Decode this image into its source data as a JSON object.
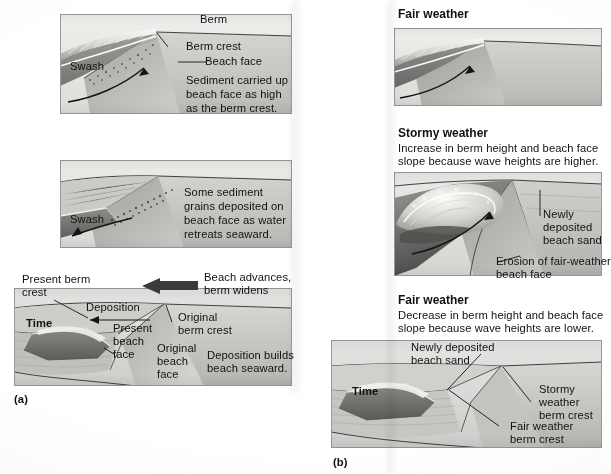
{
  "figure": {
    "part_a_label": "(a)",
    "part_b_label": "(b)"
  },
  "colors": {
    "paper": "#ffffff",
    "sand_light": "#dcdcda",
    "sand_mid": "#bdbdba",
    "sand_dark": "#8e8e8b",
    "water_dark": "#6f6f6d",
    "water_mid": "#9a9a97",
    "foam": "#f2f2f0",
    "ink": "#111111",
    "panel_bg": "#d6d6d4"
  },
  "part_a": {
    "label": "(a)",
    "panels": [
      {
        "id": "a1",
        "labels": [
          {
            "name": "berm",
            "text": "Berm"
          },
          {
            "name": "berm-crest",
            "text": "Berm crest"
          },
          {
            "name": "beach-face",
            "text": "Beach face"
          },
          {
            "name": "swash",
            "text": "Swash"
          }
        ],
        "note_lines": [
          "Sediment carried up",
          "beach face as high",
          "as the berm crest."
        ]
      },
      {
        "id": "a2",
        "labels": [
          {
            "name": "swash",
            "text": "Swash"
          }
        ],
        "note_lines": [
          "Some sediment",
          "grains deposited on",
          "beach face as water",
          "retreats seaward."
        ]
      },
      {
        "id": "a3",
        "labels": [
          {
            "name": "time",
            "text": "Time"
          },
          {
            "name": "present-berm-crest",
            "text": "Present berm\ncrest"
          },
          {
            "name": "deposition-arrow-label",
            "text": "Deposition"
          },
          {
            "name": "beach-advances",
            "text": "Beach advances,\nberm widens"
          },
          {
            "name": "original-berm-crest",
            "text": "Original\nberm crest"
          },
          {
            "name": "present-beach-face",
            "text": "Present\nbeach\nface"
          },
          {
            "name": "original-beach-face",
            "text": "Original\nbeach\nface"
          },
          {
            "name": "deposition-builds",
            "text": "Deposition builds\nbeach seaward."
          }
        ]
      }
    ]
  },
  "part_b": {
    "label": "(b)",
    "panels": [
      {
        "id": "b1",
        "heading": "Fair weather",
        "subtext_lines": [],
        "labels": []
      },
      {
        "id": "b2",
        "heading": "Stormy weather",
        "subtext_lines": [
          "Increase in berm height and beach face",
          "slope because wave heights are higher."
        ],
        "labels": [
          {
            "name": "newly-deposited-beach-sand",
            "text": "Newly\ndeposited\nbeach sand"
          },
          {
            "name": "erosion-of-fair-weather-beach-face",
            "text": "Erosion of fair-weather\nbeach face"
          }
        ]
      },
      {
        "id": "b3",
        "heading": "Fair weather",
        "subtext_lines": [
          "Decrease in berm height and beach face",
          "slope because wave heights are lower."
        ],
        "labels": [
          {
            "name": "time",
            "text": "Time"
          },
          {
            "name": "newly-deposited-beach-sand",
            "text": "Newly deposited\nbeach sand"
          },
          {
            "name": "stormy-weather-berm-crest",
            "text": "Stormy\nweather\nberm crest"
          },
          {
            "name": "fair-weather-berm-crest",
            "text": "Fair weather\nberm crest"
          }
        ]
      }
    ]
  },
  "text": {
    "berm": "Berm",
    "berm_crest": "Berm crest",
    "beach_face": "Beach face",
    "swash": "Swash",
    "a1_note_1": "Sediment carried up",
    "a1_note_2": "beach face as high",
    "a1_note_3": "as the berm crest.",
    "a2_note_1": "Some sediment",
    "a2_note_2": "grains deposited on",
    "a2_note_3": "beach face as water",
    "a2_note_4": "retreats seaward.",
    "time": "Time",
    "present_berm_1": "Present berm",
    "present_berm_2": "crest",
    "deposition": "Deposition",
    "beach_advances_1": "Beach advances,",
    "beach_advances_2": "berm widens",
    "original_berm_1": "Original",
    "original_berm_2": "berm crest",
    "present_face_1": "Present",
    "present_face_2": "beach",
    "present_face_3": "face",
    "original_face_1": "Original",
    "original_face_2": "beach",
    "original_face_3": "face",
    "deposition_builds_1": "Deposition builds",
    "deposition_builds_2": "beach seaward.",
    "label_a": "(a)",
    "fair_weather": "Fair weather",
    "stormy_weather": "Stormy weather",
    "stormy_sub_1": "Increase in berm height and beach face",
    "stormy_sub_2": "slope because wave heights are higher.",
    "newly_1": "Newly",
    "newly_2": "deposited",
    "newly_3": "beach sand",
    "erosion_1": "Erosion of fair-weather",
    "erosion_2": "beach face",
    "fair_weather_2": "Fair weather",
    "fair_sub_1": "Decrease in berm height and beach face",
    "fair_sub_2": "slope because wave heights are lower.",
    "newly_dep_1": "Newly deposited",
    "newly_dep_2": "beach sand",
    "stormy_crest_1": "Stormy",
    "stormy_crest_2": "weather",
    "stormy_crest_3": "berm crest",
    "fair_crest_1": "Fair weather",
    "fair_crest_2": "berm crest",
    "time_b": "Time",
    "label_b": "(b)"
  }
}
